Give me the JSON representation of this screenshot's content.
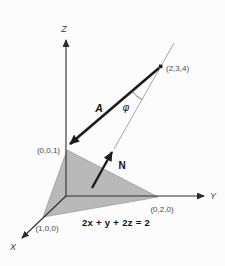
{
  "figure": {
    "equation": "2x + y + 2z = 2",
    "angle_symbol": "φ"
  },
  "axes": {
    "x_label": "X",
    "y_label": "Y",
    "z_label": "Z"
  },
  "points": {
    "z_intercept": "(0,0,1)",
    "y_intercept": "(0,2,0)",
    "x_intercept": "(1,0,0)",
    "external_point": "(2,3,4)"
  },
  "vectors": {
    "a_label": "A",
    "n_label": "N"
  },
  "colors": {
    "background": "#fcfcfc",
    "plane_fill": "#b9b9b9",
    "plane_edge": "#9a9a9a",
    "axis_line": "#2c2c2c",
    "vector_line": "#1c1c1c",
    "extension_line": "#8f8f8f",
    "arc_line": "#555555",
    "coordinate_text": "#4a4a4a",
    "axis_text": "#3a3a3a",
    "vector_text": "#111111"
  }
}
